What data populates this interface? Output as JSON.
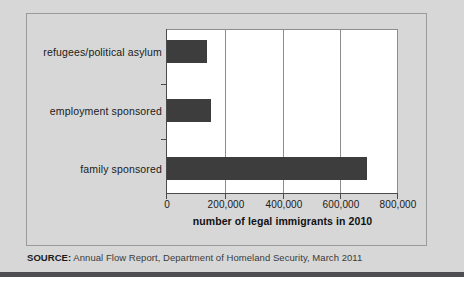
{
  "figure": {
    "source_prefix": "SOURCE:",
    "source_text": " Annual Flow Report, Department of Homeland Security, March 2011",
    "background_color": "#d7d7d7",
    "plot_background_color": "#ffffff",
    "bar_color": "#3d3d3d",
    "border_color": "#9a9a9a"
  },
  "chart_data": {
    "type": "bar",
    "orientation": "horizontal",
    "title": "",
    "subtitle": "",
    "xlabel": "number of legal immigrants in 2010",
    "ylabel": "",
    "categories": [
      "family sponsored",
      "employment sponsored",
      "refugees/political asylum"
    ],
    "values": [
      697000,
      152000,
      138000
    ],
    "series": [
      {
        "name": "number of legal immigrants in 2010",
        "values": [
          697000,
          152000,
          138000
        ]
      }
    ],
    "xlim": [
      0,
      800000
    ],
    "ylim": null,
    "xticks": [
      0,
      200000,
      400000,
      600000,
      800000
    ],
    "xticklabels": [
      "0",
      "200,000",
      "400,000",
      "600,000",
      "800,000"
    ],
    "grid": "vertical",
    "legend": null,
    "annotations": [],
    "bar_color": "#3d3d3d"
  }
}
